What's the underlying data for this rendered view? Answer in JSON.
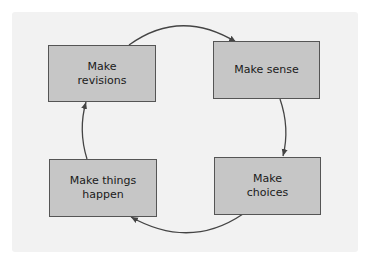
{
  "diagram": {
    "type": "cycle",
    "colors": {
      "panel": "#f2f2f2",
      "box_fill": "#c6c6c6",
      "box_border": "#555555",
      "arrow": "#444444",
      "text": "#1a1a1a"
    },
    "nodes": [
      {
        "id": "revisions",
        "line1": "Make",
        "line2": "revisions"
      },
      {
        "id": "sense",
        "line1": "Make sense",
        "line2": ""
      },
      {
        "id": "choices",
        "line1": "Make",
        "line2": "choices"
      },
      {
        "id": "happen",
        "line1": "Make things",
        "line2": "happen"
      }
    ],
    "edges": [
      {
        "from": "Make revisions",
        "to": "Make sense"
      },
      {
        "from": "Make sense",
        "to": "Make choices"
      },
      {
        "from": "Make choices",
        "to": "Make things happen"
      },
      {
        "from": "Make things happen",
        "to": "Make revisions"
      }
    ]
  }
}
